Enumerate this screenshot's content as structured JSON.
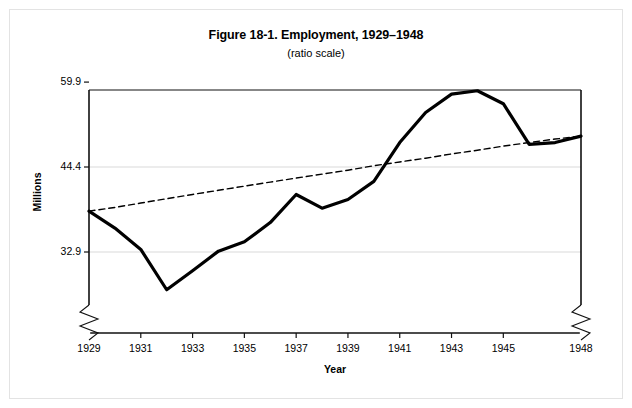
{
  "figure": {
    "title": "Figure 18-1. Employment, 1929–1948",
    "subtitle": "(ratio scale)"
  },
  "chart_data": {
    "type": "line",
    "title": "Figure 18-1. Employment, 1929–1948",
    "subtitle": "(ratio scale)",
    "xlabel": "Year",
    "ylabel": "Millions",
    "scale": "log",
    "grid": true,
    "legend": "none",
    "xlim": [
      1929,
      1948
    ],
    "ylim": [
      26.5,
      59.9
    ],
    "ytick_labels": [
      "59.9",
      "44.4",
      "32.9"
    ],
    "ytick_values": [
      59.9,
      44.4,
      32.9
    ],
    "xtick_labels": [
      "1929",
      "1931",
      "1933",
      "1935",
      "1937",
      "1939",
      "1941",
      "1943",
      "1945",
      "1948"
    ],
    "xtick_values": [
      1929,
      1931,
      1933,
      1935,
      1937,
      1939,
      1941,
      1943,
      1945,
      1948
    ],
    "axis_break": {
      "left": true,
      "right": true,
      "note": "zigzag break marks on both vertical spines near the x-axis"
    },
    "x": [
      1929,
      1930,
      1931,
      1932,
      1933,
      1934,
      1935,
      1936,
      1937,
      1938,
      1939,
      1940,
      1941,
      1942,
      1943,
      1944,
      1945,
      1946,
      1947,
      1948
    ],
    "series": [
      {
        "name": "Employment",
        "style": "solid",
        "color": "#000000",
        "width": 3.2,
        "values": [
          38.0,
          35.8,
          33.2,
          28.8,
          30.8,
          33.0,
          34.1,
          36.5,
          40.3,
          38.4,
          39.6,
          42.2,
          48.4,
          53.8,
          57.4,
          58.1,
          55.5,
          48.1,
          48.4,
          49.5
        ]
      },
      {
        "name": "Trend",
        "style": "dashed",
        "color": "#000000",
        "width": 1.4,
        "values": [
          38.0,
          38.5,
          39.1,
          39.7,
          40.3,
          40.9,
          41.5,
          42.1,
          42.7,
          43.3,
          43.9,
          44.6,
          45.2,
          45.8,
          46.5,
          47.1,
          47.8,
          48.4,
          49.0,
          49.5
        ]
      }
    ]
  },
  "axes": {
    "y_title": "Millions",
    "x_title": "Year"
  }
}
